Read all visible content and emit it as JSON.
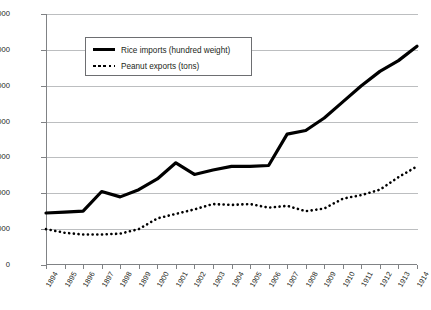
{
  "chart_data": {
    "type": "line",
    "title": "",
    "xlabel": "",
    "ylabel": "",
    "ylim": [
      0,
      140000
    ],
    "ytick_labels": [
      "0",
      "20,000",
      "40,000",
      "60,000",
      "80,000",
      "100,000",
      "120,000",
      "140,000"
    ],
    "ytick_values": [
      0,
      20000,
      40000,
      60000,
      80000,
      100000,
      120000,
      140000
    ],
    "grid": true,
    "legend_position": "upper-left-inside",
    "categories": [
      "1894",
      "1895",
      "1896",
      "1897",
      "1898",
      "1899",
      "1900",
      "1901",
      "1902",
      "1903",
      "1904",
      "1905",
      "1906",
      "1907",
      "1908",
      "1909",
      "1910",
      "1911",
      "1912",
      "1913",
      "1914"
    ],
    "series": [
      {
        "name": "Rice imports (hundred weight)",
        "style": "solid",
        "color": "#000000",
        "values": [
          29000,
          29500,
          30000,
          41000,
          38000,
          42000,
          48000,
          57000,
          50500,
          53000,
          55000,
          55000,
          55500,
          73000,
          75000,
          82000,
          91000,
          100000,
          108000,
          114000,
          122000
        ]
      },
      {
        "name": "Peanut exports (tons)",
        "style": "dotted",
        "color": "#000000",
        "values": [
          20000,
          18000,
          17000,
          17000,
          17500,
          20000,
          26000,
          28500,
          31000,
          34000,
          33500,
          34000,
          32000,
          33000,
          30000,
          31500,
          37000,
          39000,
          42000,
          49000,
          55000
        ]
      }
    ]
  },
  "legend": {
    "items": [
      {
        "label": "Rice imports (hundred weight)",
        "swatch": "solid-line-swatch"
      },
      {
        "label": "Peanut exports (tons)",
        "swatch": "dotted-line-swatch"
      }
    ]
  },
  "caption": {
    "text": ""
  }
}
